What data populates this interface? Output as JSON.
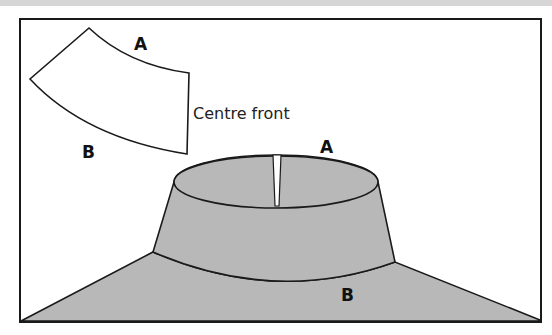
{
  "diagram": {
    "type": "sewing-pattern-illustration",
    "pattern_piece": {
      "edge_top_label": "A",
      "edge_bottom_label": "B",
      "side_label": "Centre front"
    },
    "garment": {
      "collar_top_label": "A",
      "neckline_label": "B"
    },
    "colors": {
      "frame_stroke": "#1a1a1a",
      "garment_fill": "#b8b8b8",
      "pattern_fill": "#ffffff",
      "top_bar": "#d6d6d6",
      "background": "#ffffff"
    }
  }
}
